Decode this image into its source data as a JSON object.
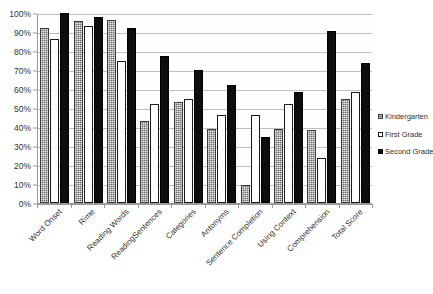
{
  "chart_data": {
    "type": "bar",
    "title": "",
    "subtitle": "",
    "xlabel": "",
    "ylabel": "",
    "ylim": [
      0,
      100
    ],
    "y_tick_labels": [
      "0%",
      "10%",
      "20%",
      "30%",
      "40%",
      "50%",
      "60%",
      "70%",
      "80%",
      "90%",
      "100%"
    ],
    "y_tick_values": [
      0,
      10,
      20,
      30,
      40,
      50,
      60,
      70,
      80,
      90,
      100
    ],
    "grid": true,
    "legend_position": "right",
    "categories": [
      "Word Onset",
      "Rime",
      "Reading Words",
      "ReadingSentences",
      "Categories",
      "Antonyms",
      "Sentence Completion",
      "Using Context",
      "Comprehension",
      "Total Score"
    ],
    "series": [
      {
        "name": "Kindergarten",
        "fill": "checkered-gray",
        "color": "#6e6e6e",
        "values": [
          92,
          96,
          96.5,
          43,
          53,
          39,
          9.5,
          39,
          38.5,
          55
        ]
      },
      {
        "name": "First Grade",
        "fill": "white-outlined",
        "color": "#ffffff",
        "values": [
          86.5,
          93,
          75,
          52,
          55,
          46.5,
          46.5,
          52,
          23.5,
          58.5
        ]
      },
      {
        "name": "Second Grade",
        "fill": "solid-black",
        "color": "#0d0d0d",
        "values": [
          100,
          98,
          92,
          77.5,
          70,
          62,
          34.5,
          58.5,
          90.5,
          73.5
        ]
      }
    ]
  },
  "legend": {
    "items": [
      {
        "label": "Kindergarten",
        "key": "kindergarten"
      },
      {
        "label": "First Grade",
        "key": "first"
      },
      {
        "label": "Second Grade",
        "key": "second"
      }
    ]
  },
  "colors": {
    "kindergarten": "#6e6e6e",
    "first_grade": "#ffffff",
    "second_grade": "#0d0d0d",
    "gridline": "#bfbfbf",
    "axis": "#9a9a9a",
    "background": "#ffffff",
    "text": "#2f2f2f"
  }
}
